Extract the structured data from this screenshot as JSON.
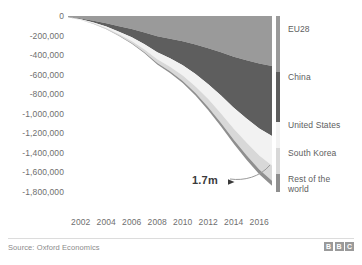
{
  "chart_data": {
    "type": "area",
    "title": "",
    "subtitle": "",
    "xlabel": "",
    "ylabel": "",
    "stacked": true,
    "grid": false,
    "legend_position": "right",
    "xlim": [
      2001,
      2017
    ],
    "ylim": [
      -1800000,
      0
    ],
    "x": [
      2001,
      2002,
      2003,
      2004,
      2005,
      2006,
      2007,
      2008,
      2009,
      2010,
      2011,
      2012,
      2013,
      2014,
      2015,
      2016,
      2017
    ],
    "x_ticks": [
      "2002",
      "2004",
      "2006",
      "2008",
      "2010",
      "2012",
      "2014",
      "2016"
    ],
    "x_tick_values": [
      2002,
      2004,
      2006,
      2008,
      2010,
      2012,
      2014,
      2016
    ],
    "y_ticks": [
      "0",
      "-200,000",
      "-400,000",
      "-600,000",
      "-800,000",
      "-1,000,000",
      "-1,200,000",
      "-1,400,000",
      "-1,600,000",
      "-1,800,000"
    ],
    "y_tick_values": [
      0,
      -200000,
      -400000,
      -600000,
      -800000,
      -1000000,
      -1200000,
      -1400000,
      -1600000,
      -1800000
    ],
    "series": [
      {
        "name": "EU28",
        "color": "#9a9a9a",
        "values": [
          -8000,
          -26000,
          -48000,
          -74000,
          -104000,
          -134000,
          -168000,
          -206000,
          -232000,
          -258000,
          -292000,
          -330000,
          -372000,
          -416000,
          -452000,
          -486000,
          -512000
        ]
      },
      {
        "name": "China",
        "color": "#5e5e5e",
        "values": [
          -2000,
          -8000,
          -18000,
          -34000,
          -56000,
          -84000,
          -120000,
          -164000,
          -200000,
          -246000,
          -302000,
          -368000,
          -442000,
          -522000,
          -596000,
          -664000,
          -716000
        ]
      },
      {
        "name": "United States",
        "color": "#f2f2f2",
        "values": [
          -1000,
          -4000,
          -9000,
          -16000,
          -26000,
          -38000,
          -54000,
          -72000,
          -86000,
          -104000,
          -126000,
          -152000,
          -182000,
          -214000,
          -246000,
          -276000,
          -300000
        ]
      },
      {
        "name": "South Korea",
        "color": "#d8d8d8",
        "values": [
          -500,
          -2000,
          -5000,
          -9000,
          -14000,
          -21000,
          -29000,
          -39000,
          -47000,
          -56000,
          -68000,
          -82000,
          -98000,
          -114000,
          -130000,
          -144000,
          -156000
        ]
      },
      {
        "name": "Rest of the\nworld",
        "color": "#8f8f8f",
        "values": [
          -200,
          -800,
          -2000,
          -3500,
          -5500,
          -8000,
          -11000,
          -15000,
          -18000,
          -22000,
          -26000,
          -31000,
          -36000,
          -41000,
          -45000,
          -49000,
          -52000
        ]
      }
    ],
    "total_values": [
      -11700,
      -40800,
      -82000,
      -136500,
      -205500,
      -285000,
      -382000,
      -496000,
      -583000,
      -686000,
      -814000,
      -963000,
      -1130000,
      -1307000,
      -1469000,
      -1619000,
      -1736000
    ],
    "annotations": [
      {
        "text": "1.7m",
        "points_to_value": -1700000,
        "points_to_year": 2017
      }
    ]
  },
  "footer": {
    "source": "Source: Oxford Economics",
    "logo_letters": [
      "B",
      "B",
      "C"
    ]
  }
}
